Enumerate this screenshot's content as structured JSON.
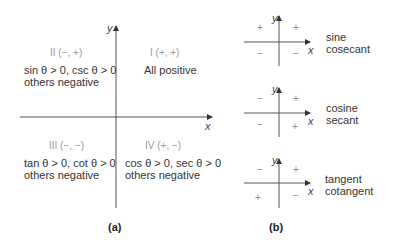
{
  "panel_a": {
    "label": "(a)",
    "axis_x": "x",
    "axis_y": "y",
    "quadrants": {
      "I": {
        "label": "I (+, +)",
        "lines": [
          "All positive"
        ]
      },
      "II": {
        "label": "II (−, +)",
        "lines": [
          "sin θ > 0, csc θ > 0",
          "others negative"
        ]
      },
      "III": {
        "label": "III (−, −)",
        "lines": [
          "tan θ > 0, cot θ > 0",
          "others negative"
        ]
      },
      "IV": {
        "label": "IV (+, −)",
        "lines": [
          "cos θ > 0, sec θ > 0",
          "others negative"
        ]
      }
    }
  },
  "panel_b": {
    "label": "(b)",
    "diagrams": [
      {
        "names": [
          "sine",
          "cosecant"
        ],
        "signs": {
          "II": "+",
          "I": "+",
          "III": "−",
          "IV": "−"
        },
        "axis_x": "x",
        "axis_y": "y"
      },
      {
        "names": [
          "cosine",
          "secant"
        ],
        "signs": {
          "II": "−",
          "I": "+",
          "III": "−",
          "IV": "+"
        },
        "axis_x": "x",
        "axis_y": "y"
      },
      {
        "names": [
          "tangent",
          "cotangent"
        ],
        "signs": {
          "II": "−",
          "I": "+",
          "III": "+",
          "IV": "−"
        },
        "axis_x": "x",
        "axis_y": "y"
      }
    ]
  }
}
